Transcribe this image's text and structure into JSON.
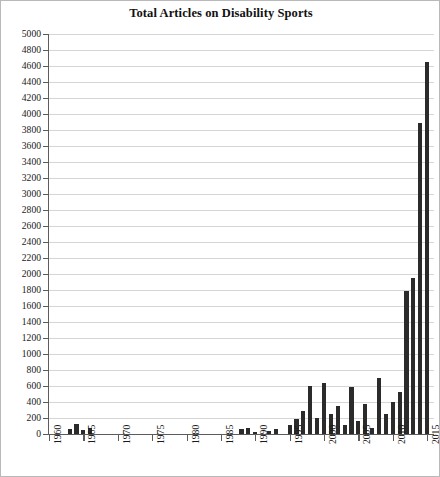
{
  "chart_data": {
    "type": "bar",
    "title": "Total Articles on Disability Sports",
    "xlabel": "",
    "ylabel": "",
    "xlim": [
      1960,
      2016
    ],
    "ylim": [
      0,
      5000
    ],
    "ytick_step": 200,
    "xtick_step": 5,
    "grid": true,
    "legend": null,
    "bar_color": "#2b2b2b",
    "grid_color": "#d6d6d6",
    "axis_color": "#5c5c5c",
    "yticks": [
      0,
      200,
      400,
      600,
      800,
      1000,
      1200,
      1400,
      1600,
      1800,
      2000,
      2200,
      2400,
      2600,
      2800,
      3000,
      3200,
      3400,
      3600,
      3800,
      4000,
      4200,
      4400,
      4600,
      4800,
      5000
    ],
    "xticks": [
      1960,
      1965,
      1970,
      1975,
      1980,
      1985,
      1990,
      1995,
      2000,
      2005,
      2010,
      2015
    ],
    "categories": [
      1960,
      1961,
      1962,
      1963,
      1964,
      1965,
      1966,
      1967,
      1968,
      1969,
      1970,
      1971,
      1972,
      1973,
      1974,
      1975,
      1976,
      1977,
      1978,
      1979,
      1980,
      1981,
      1982,
      1983,
      1984,
      1985,
      1986,
      1987,
      1988,
      1989,
      1990,
      1991,
      1992,
      1993,
      1994,
      1995,
      1996,
      1997,
      1998,
      1999,
      2000,
      2001,
      2002,
      2003,
      2004,
      2005,
      2006,
      2007,
      2008,
      2009,
      2010,
      2011,
      2012,
      2013,
      2014,
      2015
    ],
    "values": [
      0,
      0,
      0,
      60,
      130,
      50,
      70,
      0,
      0,
      0,
      0,
      0,
      0,
      0,
      0,
      0,
      0,
      0,
      0,
      0,
      0,
      0,
      0,
      0,
      0,
      0,
      0,
      0,
      60,
      80,
      30,
      0,
      40,
      60,
      0,
      110,
      190,
      290,
      600,
      200,
      640,
      250,
      350,
      110,
      590,
      160,
      370,
      75,
      700,
      250,
      400,
      530,
      1790,
      1950,
      3890,
      4650
    ]
  }
}
